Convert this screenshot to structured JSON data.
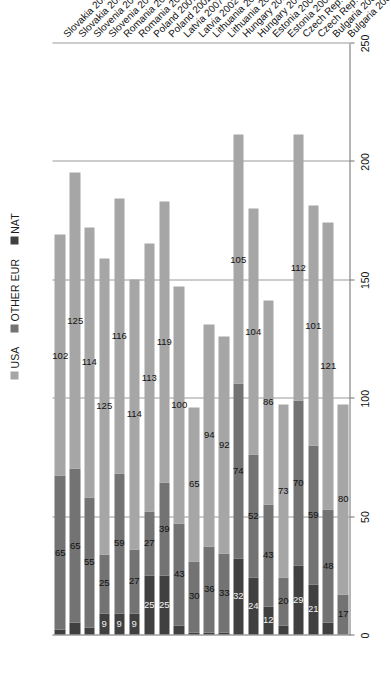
{
  "chart_data": {
    "type": "bar",
    "orientation": "horizontal-stacked",
    "title": "",
    "xlabel": "",
    "ylabel": "",
    "xlim": [
      0,
      250
    ],
    "xticks": [
      0,
      50,
      100,
      150,
      200,
      250
    ],
    "grid": true,
    "legend_position": "top",
    "stacked": true,
    "categories": [
      "Bulgaria 2002",
      "Bulgaria 2007",
      "Czech Rep. 2002",
      "Czech Rep. 2007",
      "Estonia 2002",
      "Estonia 2007",
      "Hungary 2002",
      "Hungary 2007",
      "Lithuania 2002",
      "Lithuania 2007",
      "Latvia 2002",
      "Latvia 2007",
      "Poland 2002",
      "Poland 2007",
      "Romania 2002",
      "Romania 2007",
      "Slovenia 2002",
      "Slovenia 2007",
      "Slovakia 2002",
      "Slovakia 2007"
    ],
    "series": [
      {
        "name": "NAT",
        "color": "#404040",
        "values": [
          0,
          5,
          21,
          29,
          4,
          12,
          24,
          32,
          1,
          1,
          1,
          4,
          25,
          25,
          9,
          9,
          9,
          3,
          5,
          2
        ]
      },
      {
        "name": "OTHER EUR",
        "color": "#737373",
        "values": [
          17,
          48,
          59,
          70,
          20,
          43,
          52,
          74,
          33,
          36,
          30,
          43,
          39,
          27,
          27,
          59,
          25,
          55,
          65,
          65
        ]
      },
      {
        "name": "USA",
        "color": "#a6a6a6",
        "values": [
          80,
          121,
          101,
          112,
          73,
          86,
          104,
          105,
          92,
          94,
          65,
          100,
          119,
          113,
          114,
          116,
          125,
          114,
          125,
          102
        ]
      }
    ],
    "legend": [
      {
        "label": "USA",
        "color": "#a6a6a6"
      },
      {
        "label": "OTHER EUR",
        "color": "#737373"
      },
      {
        "label": "NAT",
        "color": "#404040"
      }
    ],
    "tick_labels": [
      "0",
      "50",
      "100",
      "150",
      "200",
      "250"
    ]
  }
}
